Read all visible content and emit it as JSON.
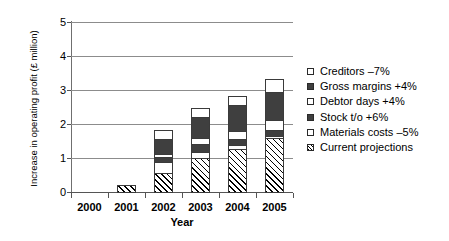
{
  "chart_data": {
    "type": "bar",
    "stacked": true,
    "title": "",
    "xlabel": "Year",
    "ylabel": "Increase in operating profit (£ million)",
    "categories": [
      "2000",
      "2001",
      "2002",
      "2003",
      "2004",
      "2005"
    ],
    "ylim": [
      0,
      5
    ],
    "yticks": [
      0,
      1,
      2,
      3,
      4,
      5
    ],
    "ytick_labels": [
      "0",
      "1",
      "2",
      "3",
      "4",
      "5"
    ],
    "grid": true,
    "legend_position": "right",
    "series": [
      {
        "name": "Current projections",
        "swatch": "hatch",
        "values": [
          0,
          0.25,
          0.6,
          1.03,
          1.3,
          1.62
        ]
      },
      {
        "name": "Materials costs –5%",
        "swatch": "white",
        "values": [
          0,
          0,
          0.35,
          0.22,
          0.15,
          0.1
        ]
      },
      {
        "name": "Stock t/o +6%",
        "swatch": "dark",
        "values": [
          0,
          0,
          0.18,
          0.25,
          0.2,
          0.2
        ]
      },
      {
        "name": "Debtor days +4%",
        "swatch": "white",
        "values": [
          0,
          0,
          0.12,
          0.22,
          0.25,
          0.32
        ]
      },
      {
        "name": "Gross margins +4%",
        "swatch": "dark",
        "values": [
          0,
          0,
          0.45,
          0.62,
          0.8,
          0.85
        ]
      },
      {
        "name": "Creditors –7%",
        "swatch": "white",
        "values": [
          0,
          0,
          0.3,
          0.31,
          0.3,
          0.41
        ]
      }
    ],
    "totals": [
      0,
      0.25,
      2.0,
      2.65,
      3.0,
      3.5
    ]
  },
  "legend": {
    "items": [
      {
        "label": "Creditors –7%",
        "swatch": "white"
      },
      {
        "label": "Gross margins +4%",
        "swatch": "dark"
      },
      {
        "label": "Debtor days +4%",
        "swatch": "white"
      },
      {
        "label": "Stock t/o +6%",
        "swatch": "dark"
      },
      {
        "label": "Materials costs –5%",
        "swatch": "white"
      },
      {
        "label": "Current projections",
        "swatch": "hatch"
      }
    ]
  },
  "axes": {
    "y_title": "Increase in operating profit (£ million)",
    "x_title": "Year"
  }
}
